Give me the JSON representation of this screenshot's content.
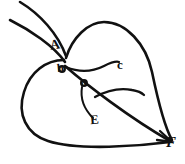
{
  "figure": {
    "background_color": "#ffffff",
    "ink_color": "#111111",
    "width": 185,
    "height": 164
  },
  "labels": {
    "a": "A",
    "b": "b",
    "c": "c",
    "d": "o",
    "e": "E",
    "f": "F"
  },
  "structure": {
    "petiole_upper": "M 20,2 C 40,14 58,34 66,56",
    "petiole_lower": "M 10,20 C 30,30 54,46 65,62",
    "right_lobe": "M 66,58 C 72,38 88,22 104,22 C 126,22 146,44 152,72 C 157,96 164,126 172,140",
    "left_lobe": "M 64,60 C 46,60 30,72 24,92 C 17,114 26,134 48,141 C 78,151 140,146 170,142",
    "midrib": "M 65,66 C 88,86 130,118 170,141",
    "vein_b_to_c": "M 66,67 C 80,73 94,71 104,66 C 110,63 116,61 119,62",
    "vein_d_to_right": "M 95,97 C 108,90 122,88 132,90 C 138,91 142,93 144,95",
    "vein_d_to_e": "M 82,87 C 80,99 85,110 93,118",
    "arrow_head_f": "M 160,131 L 172,142 L 157,140"
  },
  "points": [
    {
      "id": "a",
      "label": "A",
      "x": 56,
      "y": 45,
      "role": "petiole-junction"
    },
    {
      "id": "b",
      "label": "b",
      "x": 63,
      "y": 68,
      "role": "base-node"
    },
    {
      "id": "c",
      "label": "c",
      "x": 122,
      "y": 64,
      "role": "vein-tip"
    },
    {
      "id": "d",
      "label": "o",
      "x": 85,
      "y": 82,
      "role": "vein-node"
    },
    {
      "id": "e",
      "label": "E",
      "x": 95,
      "y": 119,
      "role": "vein-tip"
    },
    {
      "id": "f",
      "label": "F",
      "x": 172,
      "y": 142,
      "role": "leaf-apex"
    }
  ]
}
